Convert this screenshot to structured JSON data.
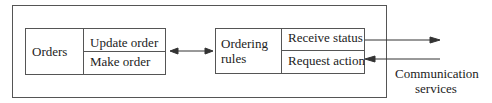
{
  "diagram": {
    "left_block": {
      "title": "Orders",
      "items": [
        "Update order",
        "Make order"
      ]
    },
    "right_block": {
      "title_line1": "Ordering",
      "title_line2": "rules",
      "items": [
        "Receive status",
        "Request action"
      ]
    },
    "external": {
      "line1": "Communication",
      "line2": "services"
    },
    "colors": {
      "line": "#333333",
      "background": "#ffffff"
    }
  }
}
